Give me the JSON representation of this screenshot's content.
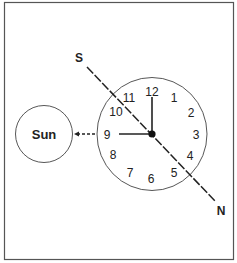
{
  "diagram": {
    "sun_label": "Sun",
    "south_label": "S",
    "north_label": "N",
    "clock_numbers": [
      "12",
      "1",
      "2",
      "3",
      "4",
      "5",
      "6",
      "7",
      "8",
      "9",
      "10",
      "11"
    ],
    "hour_hand_points_to": "9",
    "minute_hand_points_to": "12",
    "colors": {
      "stroke": "#222222",
      "frame": "#555555",
      "background": "#ffffff"
    }
  }
}
